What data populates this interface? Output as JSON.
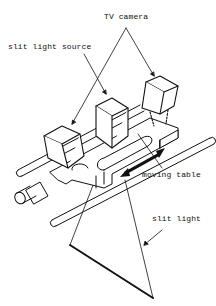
{
  "diagram": {
    "labels": {
      "tv_camera": "TV camera",
      "slit_light_source": "slit light source",
      "moving_table": "moving table",
      "slit_light": "slit light"
    },
    "components": [
      {
        "id": "slit-light-source",
        "shape": "box"
      },
      {
        "id": "tv-camera-left",
        "shape": "box"
      },
      {
        "id": "tv-camera-right",
        "shape": "box"
      },
      {
        "id": "moving-table",
        "shape": "carriage"
      },
      {
        "id": "guide-rails",
        "shape": "rods"
      },
      {
        "id": "motor",
        "shape": "cylinder"
      },
      {
        "id": "slit-light-plane",
        "shape": "triangle"
      },
      {
        "id": "direction-arrow",
        "shape": "double-arrow"
      }
    ],
    "colors": {
      "line": "#111111",
      "background": "#ffffff"
    }
  }
}
